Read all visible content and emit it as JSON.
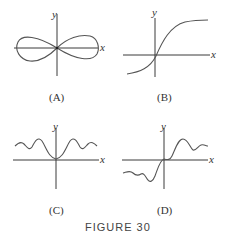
{
  "figure": {
    "title": "FIGURE 30",
    "panels": [
      {
        "id": "A",
        "caption": "(A)",
        "x_label": "x",
        "y_label": "y",
        "shape": "lemniscate (figure-eight) centered at origin"
      },
      {
        "id": "B",
        "caption": "(B)",
        "x_label": "x",
        "y_label": "y",
        "shape": "increasing S-shaped sigmoid curve with horizontal asymptotes"
      },
      {
        "id": "C",
        "caption": "(C)",
        "x_label": "x",
        "y_label": "y",
        "shape": "even function: flat at origin, damped oscillations above x-axis"
      },
      {
        "id": "D",
        "caption": "(D)",
        "x_label": "x",
        "y_label": "y",
        "shape": "odd function: flat at origin, damped oscillations above right / below left"
      }
    ]
  }
}
